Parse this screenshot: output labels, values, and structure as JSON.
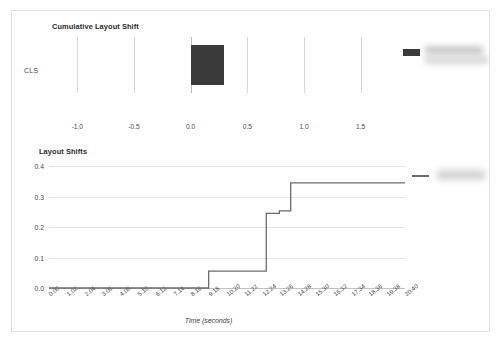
{
  "panel": {
    "name": "web-vitals-report-card"
  },
  "charts": {
    "cls": {
      "title": "Cumulative Layout Shift",
      "category_label": "CLS",
      "legend": {
        "redacted": true,
        "swatch_color": "#3a3a3a"
      }
    },
    "layout_shifts": {
      "title": "Layout Shifts",
      "xlabel": "Time (seconds)",
      "legend": {
        "redacted": true,
        "line_color": "#6b6b6b"
      }
    }
  },
  "chart_data": [
    {
      "type": "bar",
      "orientation": "horizontal",
      "title": "Cumulative Layout Shift",
      "categories": [
        "CLS"
      ],
      "values": [
        0.29
      ],
      "xlabel": "",
      "ylabel": "",
      "xlim": [
        -1.25,
        1.75
      ],
      "xticks": [
        -1.0,
        -0.5,
        0.0,
        0.5,
        1.0,
        1.5
      ],
      "xticklabels": [
        "-1.0",
        "-0.5",
        "0.0",
        "0.5",
        "1.0",
        "1.5"
      ],
      "grid": true,
      "legend_position": "top-right",
      "bar_color": "#3a3a3a"
    },
    {
      "type": "line",
      "style": "step-post",
      "title": "Layout Shifts",
      "xlabel": "Time (seconds)",
      "ylabel": "",
      "ylim": [
        0.0,
        0.4
      ],
      "yticks": [
        0.0,
        0.1,
        0.2,
        0.3,
        0.4
      ],
      "yticklabels": [
        "0.0",
        "0.1",
        "0.2",
        "0.3",
        "0.4"
      ],
      "xlim": [
        0.0,
        20.4
      ],
      "xticks": [
        0.0,
        1.02,
        2.04,
        3.06,
        4.08,
        5.1,
        6.12,
        7.14,
        8.16,
        9.18,
        10.2,
        11.22,
        12.24,
        13.26,
        14.28,
        15.3,
        16.32,
        17.34,
        18.36,
        19.38,
        20.4
      ],
      "xticklabels": [
        "0.00",
        "1.02",
        "2.04",
        "3.06",
        "4.08",
        "5.10",
        "6.12",
        "7.14",
        "8.16",
        "9.18",
        "10.20",
        "11.22",
        "12.24",
        "13.26",
        "14.28",
        "15.30",
        "16.32",
        "17.34",
        "18.36",
        "19.38",
        "20.40"
      ],
      "grid": true,
      "legend_position": "right",
      "line_color": "#6b6b6b",
      "series": [
        {
          "name": "cumulative layout shift",
          "x": [
            0.0,
            9.15,
            9.15,
            12.45,
            12.45,
            13.2,
            13.2,
            13.85,
            13.85,
            20.4
          ],
          "y": [
            0.0,
            0.0,
            0.055,
            0.055,
            0.245,
            0.245,
            0.253,
            0.253,
            0.345,
            0.345
          ]
        }
      ]
    }
  ]
}
